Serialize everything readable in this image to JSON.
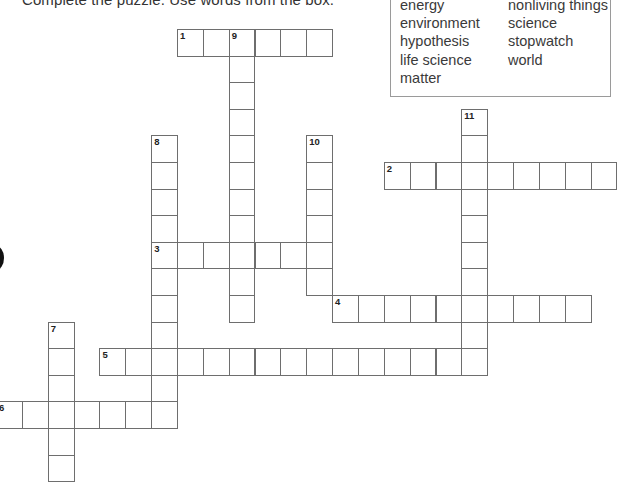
{
  "instruction": "Complete the puzzle. Use words from the box.",
  "word_box": {
    "column1": [
      "energy",
      "environment",
      "hypothesis",
      "life science",
      "matter"
    ],
    "column2": [
      "nonliving things",
      "science",
      "stopwatch",
      "world"
    ]
  },
  "grid": {
    "origin_x": 177,
    "origin_y": 29,
    "cell_w": 25.85,
    "cell_h": 26.6,
    "entries": [
      {
        "number": "1",
        "direction": "across",
        "row": 0,
        "col": 0,
        "length": 6
      },
      {
        "number": "2",
        "direction": "across",
        "row": 5,
        "col": 8,
        "length": 9
      },
      {
        "number": "3",
        "direction": "across",
        "row": 8,
        "col": -1,
        "length": 7
      },
      {
        "number": "4",
        "direction": "across",
        "row": 10,
        "col": 6,
        "length": 10
      },
      {
        "number": "5",
        "direction": "across",
        "row": 12,
        "col": -3,
        "length": 15
      },
      {
        "number": "6",
        "direction": "across",
        "row": 14,
        "col": -7,
        "length": 7
      },
      {
        "number": "7",
        "direction": "down",
        "row": 11,
        "col": -5,
        "length": 6
      },
      {
        "number": "8",
        "direction": "down",
        "row": 4,
        "col": -1,
        "length": 11
      },
      {
        "number": "9",
        "direction": "down",
        "row": 0,
        "col": 2,
        "length": 11
      },
      {
        "number": "10",
        "direction": "down",
        "row": 4,
        "col": 5,
        "length": 6
      },
      {
        "number": "11",
        "direction": "down",
        "row": 3,
        "col": 11,
        "length": 10
      }
    ]
  }
}
